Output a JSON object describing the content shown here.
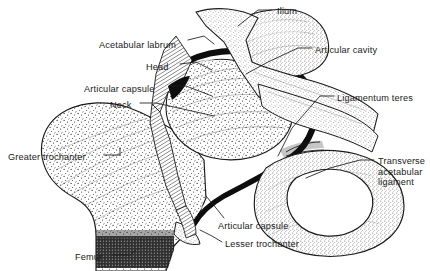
{
  "figure": {
    "background_color": "#ffffff",
    "ink_color": "#1a1a1a",
    "width": 430,
    "height": 271
  },
  "labels": [
    {
      "id": "acetabular-labrum",
      "text": "Acetabular labrum",
      "x": 99,
      "y": 40,
      "align": "left"
    },
    {
      "id": "head",
      "text": "Head",
      "x": 146,
      "y": 62,
      "align": "left"
    },
    {
      "id": "articular-capsule-top",
      "text": "Articular capsule",
      "x": 84,
      "y": 84,
      "align": "left"
    },
    {
      "id": "neck",
      "text": "Neck",
      "x": 110,
      "y": 100,
      "align": "left"
    },
    {
      "id": "greater-trochanter",
      "text": "Greater trochanter",
      "x": 8,
      "y": 152,
      "align": "left"
    },
    {
      "id": "femur",
      "text": "Femur",
      "x": 75,
      "y": 252,
      "align": "left"
    },
    {
      "id": "ilium",
      "text": "Ilium",
      "x": 277,
      "y": 6,
      "align": "left"
    },
    {
      "id": "articular-cavity",
      "text": "Articular cavity",
      "x": 315,
      "y": 45,
      "align": "left"
    },
    {
      "id": "ligamentum-teres",
      "text": "Ligamentum teres",
      "x": 337,
      "y": 93,
      "align": "left"
    },
    {
      "id": "transverse-acetabular-ligament",
      "text": "Transverse\nacetabular\nligament",
      "x": 378,
      "y": 156,
      "align": "left"
    },
    {
      "id": "articular-capsule-bottom",
      "text": "Articular capsule",
      "x": 218,
      "y": 221,
      "align": "left"
    },
    {
      "id": "lesser-trochanter",
      "text": "Lesser trochanter",
      "x": 225,
      "y": 239,
      "align": "left"
    }
  ],
  "structures": [
    {
      "id": "femur-shaft-and-trochanter",
      "name": "Femur with greater trochanter"
    },
    {
      "id": "femoral-head",
      "name": "Head of femur"
    },
    {
      "id": "femoral-neck",
      "name": "Neck of femur"
    },
    {
      "id": "articular-cartilage-arc",
      "name": "Articular cartilage / joint space"
    },
    {
      "id": "acetabular-labrum-wedge",
      "name": "Acetabular labrum"
    },
    {
      "id": "articular-capsule-hatched",
      "name": "Articular capsule"
    },
    {
      "id": "ilium-bone",
      "name": "Ilium"
    },
    {
      "id": "acetabulum",
      "name": "Acetabulum"
    },
    {
      "id": "ligamentum-teres-fibers",
      "name": "Ligamentum teres"
    },
    {
      "id": "transverse-acetabular-ligament-band",
      "name": "Transverse acetabular ligament"
    },
    {
      "id": "obturator-foramen",
      "name": "Obturator foramen"
    },
    {
      "id": "ischiopubic-ramus",
      "name": "Ischiopubic ramus"
    },
    {
      "id": "lesser-trochanter-process",
      "name": "Lesser trochanter"
    }
  ]
}
